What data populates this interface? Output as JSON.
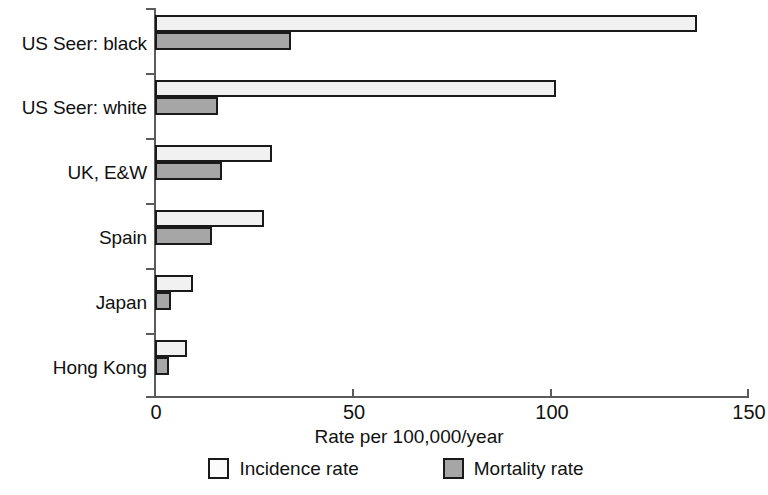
{
  "chart_data": {
    "type": "bar",
    "orientation": "horizontal",
    "title": "",
    "xlabel": "Rate per 100,000/year",
    "ylabel": "",
    "xlim": [
      0,
      150
    ],
    "xticks": [
      0,
      50,
      100,
      150
    ],
    "xticklabels": [
      "0",
      "50",
      "100",
      "150"
    ],
    "grid": false,
    "legend_position": "bottom",
    "categories": [
      "US Seer: black",
      "US Seer: white",
      "UK, E&W",
      "Spain",
      "Japan",
      "Hong Kong"
    ],
    "series": [
      {
        "name": "Incidence rate",
        "color": "#f1f1f1",
        "edge_color": "#1a1a1a",
        "values": [
          137,
          101.5,
          29.5,
          27.5,
          9.5,
          8
        ]
      },
      {
        "name": "Mortality rate",
        "color": "#a6a6a6",
        "edge_color": "#1a1a1a",
        "values": [
          34.5,
          16,
          17,
          14.5,
          4,
          3.5
        ]
      }
    ]
  },
  "axis": {
    "x_title": "Rate per 100,000/year",
    "tick_labels": [
      "0",
      "50",
      "100",
      "150"
    ]
  },
  "legend": {
    "entries": [
      {
        "label": "Incidence rate",
        "swatch": "incidence-swatch"
      },
      {
        "label": "Mortality rate",
        "swatch": "mortality-swatch"
      }
    ]
  }
}
